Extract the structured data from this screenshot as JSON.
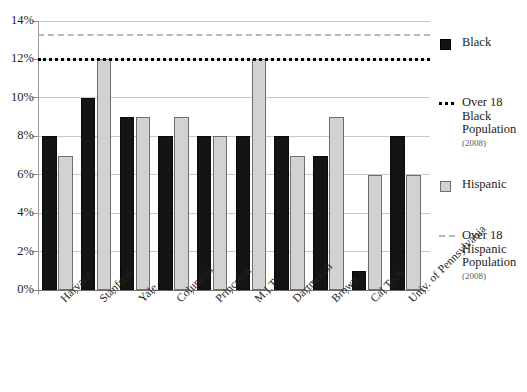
{
  "chart_data": {
    "type": "bar",
    "title": "",
    "xlabel": "",
    "ylabel": "",
    "ylim": [
      0,
      14
    ],
    "ytick_labels": [
      "0%",
      "2%",
      "4%",
      "6%",
      "8%",
      "10%",
      "12%",
      "14%"
    ],
    "ytick_values": [
      0,
      2,
      4,
      6,
      8,
      10,
      12,
      14
    ],
    "grid": true,
    "legend_position": "right",
    "categories": [
      "Harvard",
      "Stanford",
      "Yale",
      "Columbia",
      "Princeton",
      "M.I.T.",
      "Dartmouth",
      "Brown",
      "Cal Tech",
      "Univ. of Pennsylvania"
    ],
    "series": [
      {
        "name": "Black",
        "color": "#141414",
        "values": [
          8,
          10,
          9,
          8,
          8,
          8,
          8,
          7,
          1,
          8
        ]
      },
      {
        "name": "Hispanic",
        "color": "#d2d2d2",
        "values": [
          7,
          12,
          9,
          9,
          8,
          12,
          7,
          9,
          6,
          6
        ]
      }
    ],
    "reference_lines": [
      {
        "name": "Over 18 Black Population",
        "year": "(2008)",
        "value": 12.1,
        "style": "dotted",
        "color": "#000000"
      },
      {
        "name": "Over 18 Hispanic Population",
        "year": "(2008)",
        "value": 13.3,
        "style": "dashed",
        "color": "#b9b9b9"
      }
    ]
  },
  "legend": {
    "entries": [
      {
        "label": "Black",
        "marker": "black-square-swatch"
      },
      {
        "label": "Over 18\nBlack\nPopulation",
        "year": "(2008)",
        "marker": "dotted-line"
      },
      {
        "label": "Hispanic",
        "marker": "gray-square-swatch"
      },
      {
        "label": "Over 18\nHispanic\nPopulation",
        "year": "(2008)",
        "marker": "dashed-line"
      }
    ]
  }
}
